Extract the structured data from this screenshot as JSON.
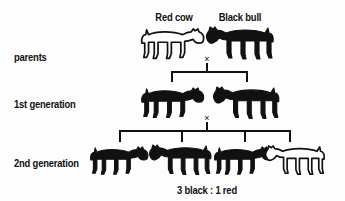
{
  "figure": {
    "type": "genetics-punnett-pedigree",
    "background_color": "#fdfdfd",
    "ink_color": "#111111",
    "title_text": "",
    "row_labels": [
      {
        "text": "parents",
        "y": 58
      },
      {
        "text": "1st generation",
        "y": 105
      },
      {
        "text": "2nd generation",
        "y": 164
      }
    ],
    "top_labels": [
      {
        "text": "Red cow",
        "x": 174,
        "y": 18
      },
      {
        "text": "Black bull",
        "x": 240,
        "y": 18
      }
    ],
    "ratio": {
      "text": "3 black : 1 red",
      "x": 207,
      "y": 191
    },
    "cross_symbols": [
      {
        "text": "×",
        "x": 207,
        "y": 59
      },
      {
        "text": "×",
        "x": 207,
        "y": 118
      }
    ],
    "generations": [
      {
        "name": "parents",
        "cattle": [
          {
            "label": "Red cow",
            "coat": "red",
            "fill": "white",
            "facing": "right",
            "kind": "cow",
            "x": 174,
            "y": 45
          },
          {
            "label": "Black bull",
            "coat": "black",
            "fill": "black",
            "facing": "left",
            "kind": "bull",
            "x": 240,
            "y": 45
          }
        ]
      },
      {
        "name": "1st generation",
        "cattle": [
          {
            "label": "Black",
            "coat": "black",
            "fill": "black",
            "facing": "right",
            "kind": "cow",
            "x": 172,
            "y": 104
          },
          {
            "label": "Black",
            "coat": "black",
            "fill": "black",
            "facing": "left",
            "kind": "bull",
            "x": 247,
            "y": 104
          }
        ]
      },
      {
        "name": "2nd generation",
        "cattle": [
          {
            "label": "Black",
            "coat": "black",
            "fill": "black",
            "facing": "right",
            "kind": "cow",
            "x": 120,
            "y": 163
          },
          {
            "label": "Black",
            "coat": "black",
            "fill": "black",
            "facing": "left",
            "kind": "bull",
            "x": 182,
            "y": 163
          },
          {
            "label": "Black",
            "coat": "black",
            "fill": "black",
            "facing": "right",
            "kind": "cow",
            "x": 245,
            "y": 163
          },
          {
            "label": "Red",
            "coat": "red",
            "fill": "white",
            "facing": "left",
            "kind": "bull",
            "x": 295,
            "y": 163
          }
        ]
      }
    ],
    "connectors": [
      {
        "name": "parents-to-f1",
        "stem_x": 207,
        "stem_top": 63,
        "bar_y": 72,
        "left": 172,
        "right": 247,
        "drops": [
          172,
          247
        ],
        "drop_bottom": 82
      },
      {
        "name": "f1-to-f2",
        "stem_x": 207,
        "stem_top": 122,
        "bar_y": 131,
        "left": 120,
        "right": 290,
        "drops": [
          120,
          182,
          245,
          290
        ],
        "drop_bottom": 142
      }
    ]
  }
}
